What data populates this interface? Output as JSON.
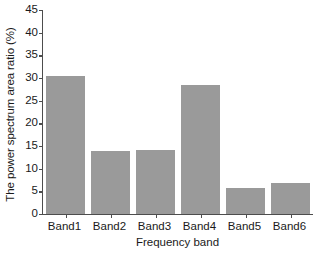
{
  "chart_data": {
    "type": "bar",
    "title": "",
    "categories": [
      "Band1",
      "Band2",
      "Band3",
      "Band4",
      "Band5",
      "Band6"
    ],
    "values": [
      30.5,
      14.0,
      14.1,
      28.4,
      5.7,
      6.9
    ],
    "xlabel": "Frequency band",
    "ylabel": "The power spectrum area ratio (%)",
    "ylim": [
      0,
      45
    ],
    "ytick_step": 5,
    "yticks": [
      0,
      5,
      10,
      15,
      20,
      25,
      30,
      35,
      40,
      45
    ],
    "ytick_labels": [
      "0",
      "5",
      "10",
      "15",
      "20",
      "25",
      "30",
      "35",
      "40",
      "45"
    ],
    "grid": false,
    "legend": null,
    "bar_color": "#9a9a9a",
    "axis_color": "#4d4d4d",
    "text_color": "#1a1a1a",
    "background": "#ffffff"
  }
}
